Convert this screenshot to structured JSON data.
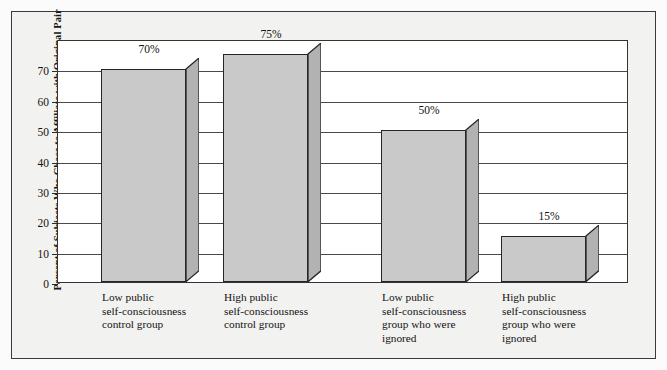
{
  "chart_data": {
    "type": "bar",
    "title": "",
    "subtitle": "",
    "xlabel": "",
    "ylabel": "Percent of Subjects Who Chose to Affiliate with Original Pair",
    "ylim": [
      0,
      80
    ],
    "yticks": [
      0,
      10,
      20,
      30,
      40,
      50,
      60,
      70
    ],
    "ytick_labels": [
      "0",
      "10",
      "20",
      "30",
      "40",
      "50",
      "60",
      "70"
    ],
    "grid": true,
    "legend": "none",
    "categories": [
      "Low public\nself-consciousness\ncontrol group",
      "High public\nself-consciousness\ncontrol group",
      "Low public\nself-consciousness\ngroup who were\nignored",
      "High public\nself-consciousness\ngroup who were\nignored"
    ],
    "values": [
      70,
      75,
      50,
      15
    ],
    "value_labels": [
      "70%",
      "75%",
      "50%",
      "15%"
    ],
    "bar_face_color": "#c9c9c9",
    "bar_side_color": "#b2b2b2",
    "bar_outline_color": "#262626",
    "panel_background": "#ffffff",
    "figure_background": "#f2f2f1",
    "frame_color": "#33342f"
  }
}
